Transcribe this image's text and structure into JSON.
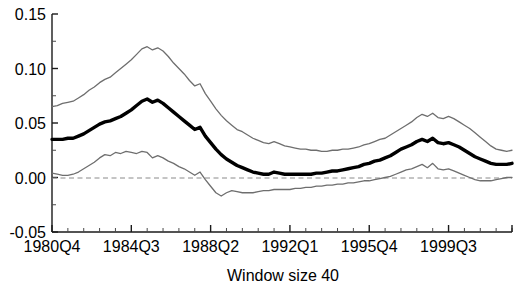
{
  "chart_data": {
    "type": "line",
    "title": "",
    "xlabel": "Window size 40",
    "ylabel": "",
    "ylim": [
      -0.05,
      0.15
    ],
    "yticks": [
      "-0.05",
      "0.00",
      "0.05",
      "0.10",
      "0.15"
    ],
    "ytick_values": [
      -0.05,
      0.0,
      0.05,
      0.1,
      0.15
    ],
    "minor_yticks_per_interval": 1,
    "xticks": [
      "1980Q4",
      "1984Q3",
      "1988Q2",
      "1992Q1",
      "1995Q4",
      "1999Q3"
    ],
    "xtick_index": [
      0,
      15,
      30,
      45,
      60,
      75
    ],
    "minor_xticks_per_interval": 4,
    "grid": false,
    "legend": "none",
    "zero_reference_line": {
      "value": 0.0,
      "style": "dashed",
      "color": "#808080"
    },
    "x_total_points": 88,
    "series": [
      {
        "name": "upper-confidence-band",
        "role": "upper",
        "color": "#6e6e6e",
        "width": 1.3,
        "values": [
          0.065,
          0.066,
          0.068,
          0.069,
          0.07,
          0.073,
          0.076,
          0.08,
          0.083,
          0.087,
          0.09,
          0.092,
          0.096,
          0.1,
          0.104,
          0.108,
          0.113,
          0.118,
          0.12,
          0.117,
          0.119,
          0.116,
          0.111,
          0.105,
          0.1,
          0.095,
          0.089,
          0.084,
          0.086,
          0.077,
          0.07,
          0.063,
          0.057,
          0.052,
          0.048,
          0.044,
          0.042,
          0.039,
          0.036,
          0.034,
          0.032,
          0.031,
          0.033,
          0.031,
          0.029,
          0.028,
          0.027,
          0.026,
          0.026,
          0.025,
          0.025,
          0.024,
          0.024,
          0.025,
          0.025,
          0.026,
          0.026,
          0.027,
          0.028,
          0.03,
          0.031,
          0.033,
          0.035,
          0.036,
          0.039,
          0.042,
          0.045,
          0.048,
          0.051,
          0.055,
          0.058,
          0.056,
          0.059,
          0.055,
          0.054,
          0.056,
          0.054,
          0.051,
          0.048,
          0.045,
          0.041,
          0.037,
          0.033,
          0.029,
          0.026,
          0.025,
          0.024,
          0.025
        ]
      },
      {
        "name": "point-estimate",
        "role": "center",
        "color": "#000000",
        "width": 3.4,
        "values": [
          0.035,
          0.035,
          0.035,
          0.036,
          0.036,
          0.038,
          0.04,
          0.043,
          0.046,
          0.049,
          0.051,
          0.052,
          0.054,
          0.056,
          0.059,
          0.062,
          0.066,
          0.07,
          0.072,
          0.069,
          0.071,
          0.068,
          0.064,
          0.06,
          0.056,
          0.052,
          0.048,
          0.044,
          0.046,
          0.038,
          0.032,
          0.026,
          0.021,
          0.017,
          0.014,
          0.011,
          0.009,
          0.007,
          0.005,
          0.004,
          0.003,
          0.003,
          0.005,
          0.004,
          0.003,
          0.003,
          0.003,
          0.003,
          0.003,
          0.003,
          0.004,
          0.004,
          0.005,
          0.006,
          0.006,
          0.007,
          0.008,
          0.009,
          0.01,
          0.012,
          0.013,
          0.015,
          0.016,
          0.018,
          0.02,
          0.023,
          0.026,
          0.028,
          0.03,
          0.033,
          0.035,
          0.033,
          0.036,
          0.032,
          0.031,
          0.032,
          0.03,
          0.028,
          0.025,
          0.022,
          0.019,
          0.017,
          0.015,
          0.013,
          0.012,
          0.012,
          0.012,
          0.013
        ]
      },
      {
        "name": "lower-confidence-band",
        "role": "lower",
        "color": "#6e6e6e",
        "width": 1.3,
        "values": [
          0.004,
          0.003,
          0.002,
          0.002,
          0.003,
          0.005,
          0.008,
          0.011,
          0.014,
          0.018,
          0.021,
          0.02,
          0.023,
          0.022,
          0.024,
          0.023,
          0.022,
          0.024,
          0.023,
          0.018,
          0.02,
          0.018,
          0.015,
          0.013,
          0.01,
          0.008,
          0.005,
          0.002,
          0.005,
          -0.002,
          -0.008,
          -0.014,
          -0.017,
          -0.014,
          -0.012,
          -0.013,
          -0.014,
          -0.014,
          -0.014,
          -0.013,
          -0.012,
          -0.012,
          -0.011,
          -0.011,
          -0.011,
          -0.011,
          -0.01,
          -0.01,
          -0.009,
          -0.009,
          -0.008,
          -0.008,
          -0.007,
          -0.007,
          -0.006,
          -0.006,
          -0.005,
          -0.005,
          -0.004,
          -0.003,
          -0.003,
          -0.002,
          -0.001,
          0.0,
          0.001,
          0.003,
          0.005,
          0.007,
          0.008,
          0.01,
          0.012,
          0.009,
          0.013,
          0.008,
          0.007,
          0.008,
          0.006,
          0.004,
          0.002,
          0.0,
          -0.002,
          -0.003,
          -0.003,
          -0.003,
          -0.002,
          -0.001,
          0.0,
          0.0
        ]
      }
    ]
  }
}
